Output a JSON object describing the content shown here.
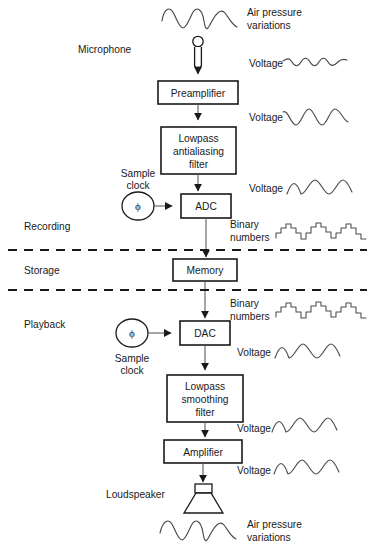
{
  "diagram": {
    "colors": {
      "background": "#ffffff",
      "box_stroke": "#1a1a1a",
      "line": "#5d5d5d",
      "wave": "#4a4a4a",
      "text": "#1a1a1a"
    },
    "blocks": [
      {
        "id": "preamplifier",
        "label": "Preamplifier",
        "lines": [
          "Preamplifier"
        ]
      },
      {
        "id": "lowpass-antialiasing-filter",
        "label": "Lowpass antialiasing filter",
        "lines": [
          "Lowpass",
          "antialiasing",
          "filter"
        ]
      },
      {
        "id": "adc",
        "label": "ADC",
        "lines": [
          "ADC"
        ]
      },
      {
        "id": "memory",
        "label": "Memory",
        "lines": [
          "Memory"
        ]
      },
      {
        "id": "dac",
        "label": "DAC",
        "lines": [
          "DAC"
        ]
      },
      {
        "id": "lowpass-smoothing-filter",
        "label": "Lowpass smoothing filter",
        "lines": [
          "Lowpass",
          "smoothing",
          "filter"
        ]
      },
      {
        "id": "amplifier",
        "label": "Amplifier",
        "lines": [
          "Amplifier"
        ]
      }
    ],
    "stages": [
      {
        "id": "recording",
        "label": "Recording"
      },
      {
        "id": "storage",
        "label": "Storage"
      },
      {
        "id": "playback",
        "label": "Playback"
      }
    ],
    "transducers": [
      {
        "id": "microphone",
        "label": "Microphone"
      },
      {
        "id": "loudspeaker",
        "label": "Loudspeaker"
      }
    ],
    "clocks": [
      {
        "id": "sample-clock-recording",
        "lines": [
          "Sample",
          "clock"
        ],
        "glyph": "ϕ"
      },
      {
        "id": "sample-clock-playback",
        "lines": [
          "Sample",
          "clock"
        ],
        "glyph": "ϕ"
      }
    ],
    "signal_labels": [
      {
        "id": "air-pressure-top",
        "lines": [
          "Air pressure",
          "variations"
        ],
        "wave": "sine-medium"
      },
      {
        "id": "voltage-mic-out",
        "lines": [
          "Voltage"
        ],
        "wave": "sine-small"
      },
      {
        "id": "voltage-preamp-out",
        "lines": [
          "Voltage"
        ],
        "wave": "sine-large"
      },
      {
        "id": "voltage-filter-out",
        "lines": [
          "Voltage"
        ],
        "wave": "sine-large"
      },
      {
        "id": "binary-numbers-adc-out",
        "lines": [
          "Binary",
          "numbers"
        ],
        "wave": "staircase"
      },
      {
        "id": "binary-numbers-memory-out",
        "lines": [
          "Binary",
          "numbers"
        ],
        "wave": "staircase"
      },
      {
        "id": "voltage-dac-out",
        "lines": [
          "Voltage"
        ],
        "wave": "sine-large"
      },
      {
        "id": "voltage-smoothing-out",
        "lines": [
          "Voltage"
        ],
        "wave": "sine-large"
      },
      {
        "id": "voltage-amp-out",
        "lines": [
          "Voltage"
        ],
        "wave": "sine-large"
      },
      {
        "id": "air-pressure-bottom",
        "lines": [
          "Air pressure",
          "variations"
        ],
        "wave": "sine-medium"
      }
    ]
  }
}
